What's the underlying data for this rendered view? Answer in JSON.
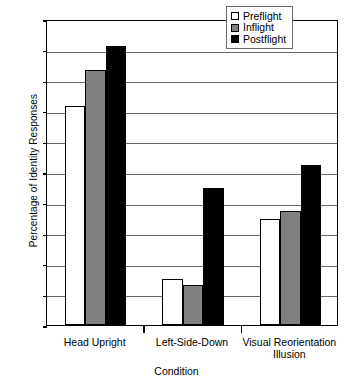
{
  "chart_data": {
    "type": "bar",
    "title": "",
    "xlabel": "Condition",
    "ylabel": "Percentage of Identity Responses",
    "ylim": [
      0,
      100
    ],
    "ytick_step": 10,
    "yticks": [
      0,
      10,
      20,
      30,
      40,
      50,
      60,
      70,
      80,
      90,
      100
    ],
    "ytick_labels": [
      "0",
      "10",
      "20",
      "30",
      "40",
      "50",
      "60",
      "70",
      "80",
      "90",
      "100"
    ],
    "grid": true,
    "grid_axis": "y",
    "legend_position": "top-right-inside",
    "categories": [
      "Head Upright",
      "Left-Side-Down",
      "Visual Reorientation Illusion"
    ],
    "category_lines": [
      [
        "Head Upright"
      ],
      [
        "Left-Side-Down"
      ],
      [
        "Visual Reorientation",
        "Illusion"
      ]
    ],
    "series": [
      {
        "name": "Preflight",
        "color": "#ffffff",
        "values": [
          71.5,
          15.0,
          34.7
        ]
      },
      {
        "name": "Inflight",
        "color": "#808080",
        "values": [
          83.3,
          13.2,
          37.2
        ]
      },
      {
        "name": "Postflight",
        "color": "#000000",
        "values": [
          91.3,
          44.8,
          52.4
        ]
      }
    ]
  },
  "axes": {
    "y_title": "Percentage of Identity Responses",
    "x_title": "Condition"
  },
  "legend": {
    "entries": [
      {
        "label": "Preflight",
        "swatch": "preflight"
      },
      {
        "label": "Inflight",
        "swatch": "inflight"
      },
      {
        "label": "Postflight",
        "swatch": "postflight"
      }
    ]
  }
}
